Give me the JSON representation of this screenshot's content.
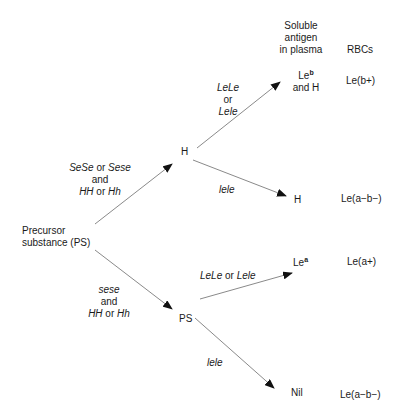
{
  "headers": {
    "soluble_line1": "Soluble",
    "soluble_line2": "antigen",
    "soluble_line3": "in plasma",
    "rbcs": "RBCs"
  },
  "nodes": {
    "precursor_line1": "Precursor",
    "precursor_line2": "substance (PS)",
    "h_mid": "H",
    "ps_mid": "PS",
    "leb_base": "Le",
    "leb_sup": "b",
    "leb_and": "and H",
    "h_out": "H",
    "lea_base": "Le",
    "lea_sup": "a",
    "nil": "Nil"
  },
  "rbc_phenotypes": {
    "leb_pos": "Le(b+)",
    "h_neg": "Le(a−b−)",
    "lea_pos": "Le(a+)",
    "nil_neg": "Le(a−b−)"
  },
  "edge_labels": {
    "ps_to_h": {
      "g1": "SeSe",
      "or1": " or ",
      "g2": "Sese",
      "and": "and",
      "g3": "HH",
      "or2": " or ",
      "g4": "Hh"
    },
    "ps_to_ps": {
      "g1": "sese",
      "and": "and",
      "g3": "HH",
      "or2": " or ",
      "g4": "Hh"
    },
    "h_to_leb": {
      "g1": "LeLe",
      "or": "or",
      "g2": "Lele"
    },
    "h_to_h": {
      "g1": "lele"
    },
    "ps_to_lea": {
      "g1": "LeLe",
      "or": " or ",
      "g2": "Lele"
    },
    "ps_to_nil": {
      "g1": "lele"
    }
  },
  "colors": {
    "line": "#8a8a8a",
    "arrowhead": "#111111",
    "text": "#1a1a1a"
  }
}
